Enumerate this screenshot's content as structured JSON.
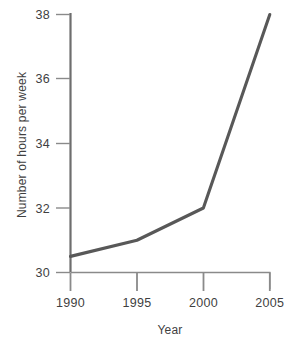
{
  "chart_data": {
    "type": "line",
    "title": "",
    "xlabel": "Year",
    "ylabel": "Number of hours per week",
    "x": [
      1990,
      1995,
      2000,
      2005
    ],
    "xticklabels": [
      "1990",
      "1995",
      "2000",
      "2005"
    ],
    "yticks": [
      30,
      32,
      34,
      36,
      38
    ],
    "yticklabels": [
      "30",
      "32",
      "34",
      "36",
      "38"
    ],
    "xlim": [
      1990,
      2005
    ],
    "ylim": [
      30,
      38
    ],
    "grid": false,
    "legend": null,
    "series": [
      {
        "name": "Number of hours per week",
        "values": [
          30.5,
          31.0,
          32.0,
          38.0
        ],
        "color": "#585858"
      }
    ]
  },
  "axes": {
    "y_title": "Number of hours per week",
    "x_title": "Year",
    "y_tick_labels": [
      "38",
      "36",
      "34",
      "32",
      "30"
    ],
    "x_tick_labels": [
      "1990",
      "1995",
      "2000",
      "2005"
    ],
    "axis_color": "#6e6e6e",
    "line_color": "#585858"
  }
}
